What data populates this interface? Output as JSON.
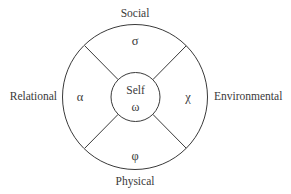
{
  "diagram": {
    "background_color": "#ffffff",
    "stroke_color": "#3a3a3a",
    "text_color": "#3a3a3a",
    "center": {
      "label": "Self",
      "symbol": "ω"
    },
    "quadrants": [
      {
        "id": "social",
        "label": "Social",
        "symbol": "σ",
        "position": "top"
      },
      {
        "id": "environmental",
        "label": "Environmental",
        "symbol": "χ",
        "position": "right"
      },
      {
        "id": "physical",
        "label": "Physical",
        "symbol": "φ",
        "position": "bottom"
      },
      {
        "id": "relational",
        "label": "Relational",
        "symbol": "α",
        "position": "left"
      }
    ]
  }
}
